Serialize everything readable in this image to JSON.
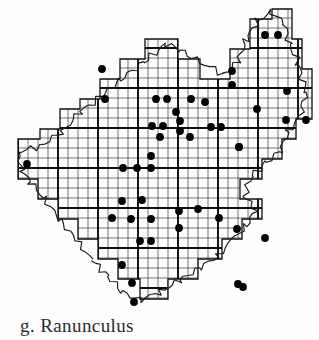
{
  "figure": {
    "caption": "g. Ranunculus",
    "caption_letter": "g.",
    "taxon_name": "Ranunculus",
    "map_type": "dot distribution map",
    "region_outline": "irregular county boundary with wavy river edges"
  },
  "colors": {
    "background": "#fefefe",
    "ink": "#141414",
    "grid_fine": "#3b3b3b",
    "grid_major": "#0f0f0f",
    "boundary": "#1a1a1a",
    "dot_fill": "#000000",
    "caption_text": "#2b2b2b"
  },
  "chart_data": {
    "type": "scatter",
    "title": "g. Ranunculus",
    "xlabel": "",
    "ylabel": "",
    "xlim": [
      0,
      319
    ],
    "ylim": [
      0,
      310
    ],
    "grid": true,
    "legend": "none",
    "grid_spec": {
      "fine_spacing": 10,
      "major_spacing": 40,
      "fine_stroke": 0.7,
      "major_stroke": 1.9,
      "origin_x": 18,
      "origin_y": 8
    },
    "dot_radius": 3.9,
    "dot_count": 57,
    "points": [
      [
        265,
        35
      ],
      [
        278,
        35
      ],
      [
        102,
        69
      ],
      [
        232,
        71
      ],
      [
        232,
        85
      ],
      [
        156,
        99
      ],
      [
        167,
        99
      ],
      [
        191,
        99
      ],
      [
        287,
        91
      ],
      [
        180,
        121
      ],
      [
        180,
        131
      ],
      [
        152,
        126
      ],
      [
        163,
        126
      ],
      [
        257,
        109
      ],
      [
        211,
        127
      ],
      [
        221,
        127
      ],
      [
        160,
        137
      ],
      [
        190,
        137
      ],
      [
        286,
        120
      ],
      [
        306,
        120
      ],
      [
        239,
        147
      ],
      [
        27,
        164
      ],
      [
        123,
        168
      ],
      [
        137,
        168
      ],
      [
        151,
        168
      ],
      [
        151,
        156
      ],
      [
        239,
        147
      ],
      [
        122,
        201
      ],
      [
        142,
        200
      ],
      [
        198,
        209
      ],
      [
        112,
        218
      ],
      [
        131,
        219
      ],
      [
        151,
        219
      ],
      [
        179,
        211
      ],
      [
        179,
        228
      ],
      [
        219,
        218
      ],
      [
        237,
        229
      ],
      [
        265,
        238
      ],
      [
        140,
        241
      ],
      [
        151,
        241
      ],
      [
        122,
        265
      ],
      [
        132,
        283
      ],
      [
        134,
        302
      ],
      [
        238,
        284
      ],
      [
        243,
        287
      ],
      [
        105,
        99
      ],
      [
        205,
        102
      ],
      [
        176,
        112
      ]
    ],
    "boundary_path": "M 18,156 L 18,139 L 40,139 L 40,129 L 60,129 L 60,109 L 80,109 L 80,99 L 100,99 L 100,79 L 120,79 L 120,59 L 145,59 L 145,39 L 178,39 L 178,59 L 200,59 L 200,79 L 230,79 L 230,49 L 250,49 L 250,19 L 272,19 L 272,9 L 292,9 L 292,39 L 302,39 L 302,69 L 312,69 L 312,119 L 296,119 L 296,139 L 282,139 L 282,159 L 262,159 L 262,179 L 240,179 L 240,199 L 262,199 L 262,219 L 242,219 L 242,239 L 222,239 L 222,259 L 198,259 L 198,279 L 168,279 L 168,299 L 140,299 L 140,279 L 118,279 L 118,259 L 98,259 L 98,239 L 78,239 L 78,219 L 58,219 L 58,199 L 38,199 L 38,179 L 18,179 Z"
  },
  "accessibility": {
    "alt": "Black and white scanned distribution map showing a gridded county outline with filled dots marking occurrence records, captioned g. Ranunculus"
  }
}
